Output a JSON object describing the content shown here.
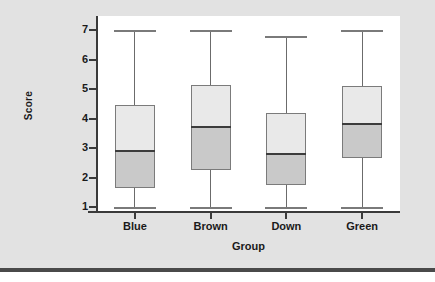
{
  "chart_data": {
    "type": "box",
    "title": "",
    "xlabel": "Group",
    "ylabel": "Score",
    "categories": [
      "Blue",
      "Brown",
      "Down",
      "Green"
    ],
    "ylim": [
      1,
      7
    ],
    "ytick_labels": [
      "1",
      "2",
      "3",
      "4",
      "5",
      "6",
      "7"
    ],
    "ytick_values": [
      1,
      2,
      3,
      4,
      5,
      6,
      7
    ],
    "grid": false,
    "legend": "none",
    "boxes": [
      {
        "category": "Blue",
        "whisker_low": 1.0,
        "q1": 1.65,
        "median": 2.9,
        "q3": 4.45,
        "whisker_high": 7.0
      },
      {
        "category": "Brown",
        "whisker_low": 1.0,
        "q1": 2.25,
        "median": 3.7,
        "q3": 5.15,
        "whisker_high": 7.0
      },
      {
        "category": "Down",
        "whisker_low": 1.0,
        "q1": 1.75,
        "median": 2.8,
        "q3": 4.2,
        "whisker_high": 6.8
      },
      {
        "category": "Green",
        "whisker_low": 1.0,
        "q1": 2.65,
        "median": 3.8,
        "q3": 5.1,
        "whisker_high": 7.0
      }
    ],
    "colors": {
      "panel_background": "#e2e2e2",
      "plot_background": "#ffffff",
      "axis": "#3a3a3a",
      "box_upper_fill": "#e9e9e9",
      "box_lower_fill": "#c9c9c9",
      "box_outline": "#7b7b7b",
      "median": "#3c3c3c",
      "whisker": "#7a7a7a",
      "bottom_rule": "#4a4a4a"
    }
  }
}
